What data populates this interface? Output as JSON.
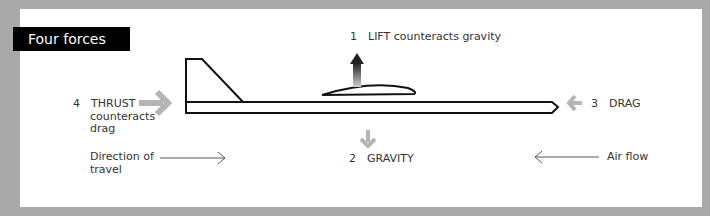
{
  "title": "Four forces",
  "forces": {
    "lift": {
      "number": "1",
      "label": "LIFT counteracts gravity"
    },
    "gravity": {
      "number": "2",
      "label": "GRAVITY"
    },
    "drag": {
      "number": "3",
      "label": "DRAG"
    },
    "thrust": {
      "number": "4",
      "label": "THRUST",
      "line2": "counteracts",
      "line3": "drag"
    }
  },
  "direction_of_travel": {
    "line1": "Direction of",
    "line2": "travel"
  },
  "air_flow": "Air flow",
  "colors": {
    "background": "#a9a9a9",
    "panel": "#ffffff",
    "title_bg": "#000000",
    "force_arrow": "#b5b5b5",
    "outline": "#111111"
  }
}
